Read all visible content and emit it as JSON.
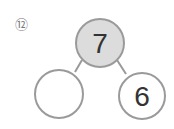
{
  "problem": {
    "number_label": "⑫",
    "top": "7",
    "left": "",
    "right": "6"
  },
  "colors": {
    "stroke": "#9a9a9a",
    "top_fill": "#dcdcdc",
    "text": "#333333"
  }
}
